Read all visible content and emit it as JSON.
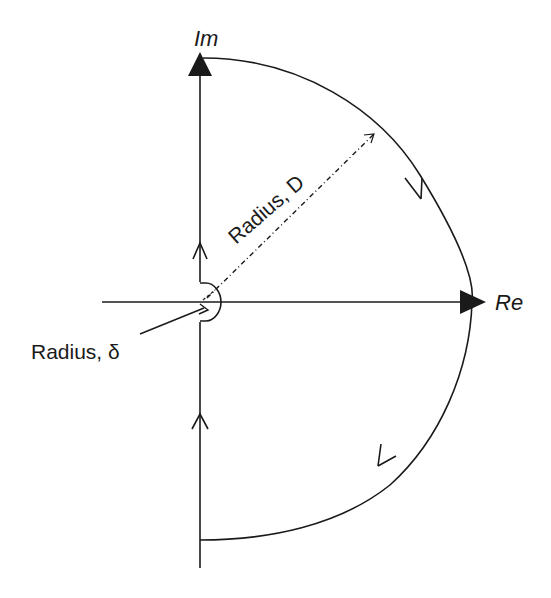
{
  "diagram": {
    "axes": {
      "imaginary_label": "Im",
      "real_label": "Re"
    },
    "annotations": {
      "large_radius_label": "Radius, D",
      "small_radius_label": "Radius, δ"
    },
    "colors": {
      "stroke": "#1a1a1a",
      "background": "#ffffff"
    }
  }
}
